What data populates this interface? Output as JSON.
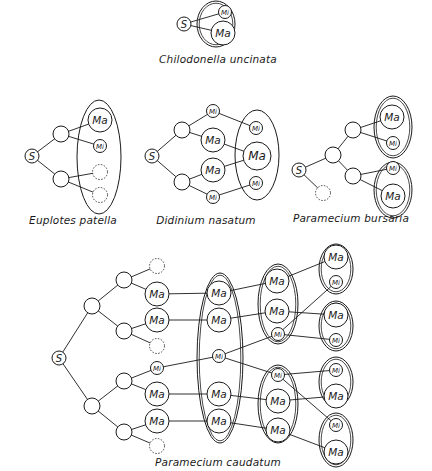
{
  "legend": {
    "S": "S",
    "Ma": "Ma",
    "Mi": "Mi"
  },
  "colors": {
    "stroke": "#1a1a1a",
    "background": "#ffffff"
  },
  "diagrams": [
    {
      "id": "chilodonella",
      "caption": "Chilodonella uncinata",
      "caption_pos": [
        218,
        60
      ],
      "nodes": [
        {
          "id": "s",
          "type": "S",
          "x": 184,
          "y": 24
        },
        {
          "id": "mi",
          "type": "Mi",
          "x": 225,
          "y": 12
        },
        {
          "id": "ma",
          "type": "Ma",
          "x": 223,
          "y": 33
        }
      ],
      "edges": [
        [
          "s",
          "mi"
        ],
        [
          "s",
          "ma"
        ]
      ],
      "ellipses": [
        {
          "cx": 216,
          "cy": 24,
          "rx": 19,
          "ry": 23,
          "double": true
        }
      ]
    },
    {
      "id": "euplotes",
      "caption": "Euplotes patella",
      "caption_pos": [
        73,
        221
      ],
      "nodes": [
        {
          "id": "s",
          "type": "S",
          "x": 32,
          "y": 156
        },
        {
          "id": "n1",
          "type": "empty",
          "x": 61,
          "y": 134
        },
        {
          "id": "n2",
          "type": "empty",
          "x": 61,
          "y": 179
        },
        {
          "id": "ma",
          "type": "Ma",
          "x": 100,
          "y": 120
        },
        {
          "id": "mi",
          "type": "Mi",
          "x": 100,
          "y": 146
        },
        {
          "id": "d1",
          "type": "dashed",
          "x": 100,
          "y": 172
        },
        {
          "id": "d2",
          "type": "dashed",
          "x": 100,
          "y": 195
        }
      ],
      "edges": [
        [
          "s",
          "n1"
        ],
        [
          "s",
          "n2"
        ],
        [
          "n1",
          "ma"
        ],
        [
          "n1",
          "mi"
        ],
        [
          "n2",
          "d1"
        ],
        [
          "n2",
          "d2"
        ]
      ],
      "ellipses": [
        {
          "cx": 99,
          "cy": 157,
          "rx": 22,
          "ry": 57,
          "double": false
        }
      ]
    },
    {
      "id": "didinium",
      "caption": "Didinium nasatum",
      "caption_pos": [
        206,
        221
      ],
      "nodes": [
        {
          "id": "s",
          "type": "S",
          "x": 152,
          "y": 156
        },
        {
          "id": "n1",
          "type": "empty",
          "x": 182,
          "y": 130
        },
        {
          "id": "n2",
          "type": "empty",
          "x": 182,
          "y": 182
        },
        {
          "id": "a1",
          "type": "Mi",
          "x": 213,
          "y": 111
        },
        {
          "id": "a2",
          "type": "Ma",
          "x": 213,
          "y": 140
        },
        {
          "id": "a3",
          "type": "Ma",
          "x": 213,
          "y": 170
        },
        {
          "id": "a4",
          "type": "Mi",
          "x": 213,
          "y": 197
        },
        {
          "id": "b1",
          "type": "Mi",
          "x": 256,
          "y": 128
        },
        {
          "id": "b2",
          "type": "MaL",
          "x": 257,
          "y": 156
        },
        {
          "id": "b3",
          "type": "Mi",
          "x": 256,
          "y": 183
        }
      ],
      "edges": [
        [
          "s",
          "n1"
        ],
        [
          "s",
          "n2"
        ],
        [
          "n1",
          "a1"
        ],
        [
          "n1",
          "a2"
        ],
        [
          "n2",
          "a3"
        ],
        [
          "n2",
          "a4"
        ],
        [
          "a1",
          "b1"
        ],
        [
          "a2",
          "b2"
        ],
        [
          "a3",
          "b2"
        ],
        [
          "a4",
          "b3"
        ]
      ],
      "ellipses": [
        {
          "cx": 257,
          "cy": 155,
          "rx": 22,
          "ry": 45,
          "double": false
        }
      ]
    },
    {
      "id": "bursaria",
      "caption": "Paramecium bursaria",
      "caption_pos": [
        351,
        219
      ],
      "nodes": [
        {
          "id": "s",
          "type": "S",
          "x": 299,
          "y": 170
        },
        {
          "id": "d",
          "type": "dashed",
          "x": 323,
          "y": 193
        },
        {
          "id": "n0",
          "type": "empty",
          "x": 333,
          "y": 155
        },
        {
          "id": "n1",
          "type": "empty",
          "x": 353,
          "y": 130
        },
        {
          "id": "n2",
          "type": "empty",
          "x": 353,
          "y": 176
        },
        {
          "id": "ma1",
          "type": "Ma",
          "x": 392,
          "y": 117
        },
        {
          "id": "mi1",
          "type": "Mi",
          "x": 393,
          "y": 143
        },
        {
          "id": "mi2",
          "type": "Mi",
          "x": 393,
          "y": 168
        },
        {
          "id": "ma2",
          "type": "Ma",
          "x": 393,
          "y": 196
        }
      ],
      "edges": [
        [
          "s",
          "n0"
        ],
        [
          "s",
          "d"
        ],
        [
          "n0",
          "n1"
        ],
        [
          "n0",
          "n2"
        ],
        [
          "n1",
          "ma1"
        ],
        [
          "n1",
          "mi1"
        ],
        [
          "n2",
          "mi2"
        ],
        [
          "n2",
          "ma2"
        ]
      ],
      "ellipses": [
        {
          "cx": 393,
          "cy": 127,
          "rx": 19,
          "ry": 31,
          "double": true
        },
        {
          "cx": 393,
          "cy": 190,
          "rx": 19,
          "ry": 28,
          "double": true
        }
      ]
    },
    {
      "id": "caudatum",
      "caption": "Paramecium caudatum",
      "caption_pos": [
        218,
        463
      ],
      "nodes": [
        {
          "id": "s",
          "type": "S",
          "x": 59,
          "y": 358
        },
        {
          "id": "l1a",
          "type": "empty",
          "x": 92,
          "y": 306
        },
        {
          "id": "l1b",
          "type": "empty",
          "x": 92,
          "y": 406
        },
        {
          "id": "l2a",
          "type": "empty",
          "x": 124,
          "y": 280
        },
        {
          "id": "l2b",
          "type": "empty",
          "x": 124,
          "y": 331
        },
        {
          "id": "l2c",
          "type": "empty",
          "x": 124,
          "y": 381
        },
        {
          "id": "l2d",
          "type": "empty",
          "x": 124,
          "y": 432
        },
        {
          "id": "l3a",
          "type": "dashed",
          "x": 157,
          "y": 266
        },
        {
          "id": "l3b",
          "type": "Ma",
          "x": 157,
          "y": 294
        },
        {
          "id": "l3c",
          "type": "Ma",
          "x": 157,
          "y": 320
        },
        {
          "id": "l3d",
          "type": "dashed",
          "x": 157,
          "y": 346
        },
        {
          "id": "l3e",
          "type": "Mi",
          "x": 157,
          "y": 368
        },
        {
          "id": "l3f",
          "type": "Ma",
          "x": 157,
          "y": 394
        },
        {
          "id": "l3g",
          "type": "Ma",
          "x": 157,
          "y": 421
        },
        {
          "id": "l3h",
          "type": "dashed",
          "x": 157,
          "y": 446
        },
        {
          "id": "c4a",
          "type": "Ma",
          "x": 219,
          "y": 293
        },
        {
          "id": "c4b",
          "type": "Ma",
          "x": 219,
          "y": 320
        },
        {
          "id": "c4c",
          "type": "Mi",
          "x": 219,
          "y": 356
        },
        {
          "id": "c4d",
          "type": "Ma",
          "x": 219,
          "y": 394
        },
        {
          "id": "c4e",
          "type": "Ma",
          "x": 219,
          "y": 421
        },
        {
          "id": "c5a",
          "type": "Ma",
          "x": 277,
          "y": 281
        },
        {
          "id": "c5b",
          "type": "Ma",
          "x": 277,
          "y": 311
        },
        {
          "id": "c5c",
          "type": "Mi",
          "x": 278,
          "y": 334
        },
        {
          "id": "c5d",
          "type": "Mi",
          "x": 278,
          "y": 375
        },
        {
          "id": "c5e",
          "type": "Ma",
          "x": 278,
          "y": 401
        },
        {
          "id": "c5f",
          "type": "Ma",
          "x": 278,
          "y": 430
        },
        {
          "id": "c6a",
          "type": "Ma",
          "x": 336,
          "y": 257
        },
        {
          "id": "c6b",
          "type": "Mi",
          "x": 336,
          "y": 282
        },
        {
          "id": "c6c",
          "type": "Ma",
          "x": 336,
          "y": 315
        },
        {
          "id": "c6d",
          "type": "Mi",
          "x": 336,
          "y": 340
        },
        {
          "id": "c6e",
          "type": "Mi",
          "x": 336,
          "y": 370
        },
        {
          "id": "c6f",
          "type": "Ma",
          "x": 336,
          "y": 396
        },
        {
          "id": "c6g",
          "type": "Mi",
          "x": 336,
          "y": 425
        },
        {
          "id": "c6h",
          "type": "Ma",
          "x": 336,
          "y": 452
        }
      ],
      "edges": [
        [
          "s",
          "l1a"
        ],
        [
          "s",
          "l1b"
        ],
        [
          "l1a",
          "l2a"
        ],
        [
          "l1a",
          "l2b"
        ],
        [
          "l1b",
          "l2c"
        ],
        [
          "l1b",
          "l2d"
        ],
        [
          "l2a",
          "l3a"
        ],
        [
          "l2a",
          "l3b"
        ],
        [
          "l2b",
          "l3c"
        ],
        [
          "l2b",
          "l3d"
        ],
        [
          "l2c",
          "l3e"
        ],
        [
          "l2c",
          "l3f"
        ],
        [
          "l2d",
          "l3g"
        ],
        [
          "l2d",
          "l3h"
        ],
        [
          "l3b",
          "c4a"
        ],
        [
          "l3c",
          "c4b"
        ],
        [
          "l3e",
          "c4c"
        ],
        [
          "l3f",
          "c4d"
        ],
        [
          "l3g",
          "c4e"
        ],
        [
          "c4a",
          "c5a"
        ],
        [
          "c4b",
          "c5b"
        ],
        [
          "c4c",
          "c5c"
        ],
        [
          "c4c",
          "c5d"
        ],
        [
          "c4d",
          "c5e"
        ],
        [
          "c4e",
          "c5f"
        ],
        [
          "c5a",
          "c6a"
        ],
        [
          "c5c",
          "c6b"
        ],
        [
          "c5b",
          "c6c"
        ],
        [
          "c5c",
          "c6d"
        ],
        [
          "c5d",
          "c6e"
        ],
        [
          "c5e",
          "c6f"
        ],
        [
          "c5d",
          "c6g"
        ],
        [
          "c5f",
          "c6h"
        ]
      ],
      "ellipses": [
        {
          "cx": 220,
          "cy": 358,
          "rx": 23,
          "ry": 85,
          "double": true
        },
        {
          "cx": 278,
          "cy": 304,
          "rx": 20,
          "ry": 40,
          "double": true
        },
        {
          "cx": 278,
          "cy": 404,
          "rx": 20,
          "ry": 39,
          "double": true
        },
        {
          "cx": 336,
          "cy": 269,
          "rx": 17,
          "ry": 25,
          "double": true
        },
        {
          "cx": 336,
          "cy": 326,
          "rx": 17,
          "ry": 25,
          "double": true
        },
        {
          "cx": 336,
          "cy": 382,
          "rx": 17,
          "ry": 25,
          "double": true
        },
        {
          "cx": 336,
          "cy": 440,
          "rx": 17,
          "ry": 27,
          "double": true
        }
      ]
    }
  ]
}
